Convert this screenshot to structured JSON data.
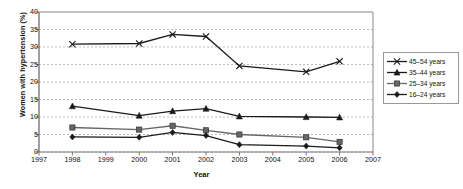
{
  "chart_data": {
    "type": "line",
    "title": "",
    "xlabel": "Year",
    "ylabel": "Women with hypertension (%)",
    "xlim": [
      1997,
      2007
    ],
    "ylim": [
      0,
      40
    ],
    "ytick_step": 5,
    "grid": true,
    "grid_style": "dashed-horizontal",
    "legend_position": "right-outside",
    "x": [
      1998,
      2000,
      2001,
      2002,
      2003,
      2005,
      2006
    ],
    "xticks": [
      "1997",
      "1998",
      "1999",
      "2000",
      "2001",
      "2002",
      "2003",
      "2004",
      "2005",
      "2006",
      "2007"
    ],
    "yticks": [
      "0",
      "5",
      "10",
      "15",
      "20",
      "25",
      "30",
      "35",
      "40"
    ],
    "series": [
      {
        "name": "45–54 years",
        "marker": "x-cross",
        "color": "#1a1a1a",
        "values": [
          30.8,
          31.0,
          33.6,
          33.0,
          24.6,
          22.9,
          25.9
        ]
      },
      {
        "name": "35–44 years",
        "marker": "triangle",
        "color": "#1a1a1a",
        "values": [
          13.1,
          10.4,
          11.7,
          12.4,
          10.2,
          10.0,
          9.9
        ]
      },
      {
        "name": "25–34 years",
        "marker": "square",
        "color": "#666666",
        "values": [
          7.0,
          6.4,
          7.5,
          6.2,
          5.0,
          4.2,
          2.9
        ]
      },
      {
        "name": "16–24 years",
        "marker": "diamond",
        "color": "#1a1a1a",
        "values": [
          4.3,
          4.2,
          5.6,
          4.7,
          2.1,
          1.7,
          1.2
        ]
      }
    ]
  },
  "legend": {
    "entries": [
      {
        "label": "45–54 years",
        "marker": "x-cross"
      },
      {
        "label": "35–44 years",
        "marker": "triangle"
      },
      {
        "label": "25–34 years",
        "marker": "square"
      },
      {
        "label": "16–24 years",
        "marker": "diamond"
      }
    ]
  }
}
